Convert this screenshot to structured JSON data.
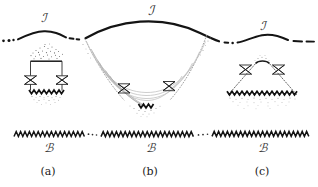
{
  "figure": {
    "background_color": "#ffffff",
    "ink_color": "#1a1a1a",
    "faint_color": "#b9b9b9",
    "dot_color": "#7a7a7a",
    "width": 318,
    "height": 187
  },
  "labels": {
    "scri_a": "ℐ",
    "scri_b": "ℐ",
    "scri_c": "ℐ",
    "boundary_a": "ℬ",
    "boundary_b": "ℬ",
    "boundary_c": "ℬ",
    "caption_a": "(a)",
    "caption_b": "(b)",
    "caption_c": "(c)"
  },
  "panels": [
    {
      "id": "a",
      "caption": "(a)",
      "scri_label": "ℐ",
      "boundary_label": "ℬ",
      "shape": "rectangle-trapped-region",
      "lightcones": 2,
      "has_top_scatter": true,
      "has_bottom_scatter": true,
      "has_zigzag_singularity": true
    },
    {
      "id": "b",
      "caption": "(b)",
      "scri_label": "ℐ",
      "boundary_label": "ℬ",
      "shape": "downward-funnel",
      "lightcones": 2,
      "has_top_scatter": false,
      "has_bottom_scatter": true,
      "has_zigzag_singularity": true,
      "inner_curves": 4
    },
    {
      "id": "c",
      "caption": "(c)",
      "scri_label": "ℐ",
      "boundary_label": "ℬ",
      "shape": "upward-triangle",
      "lightcones": 2,
      "has_top_scatter": true,
      "has_bottom_scatter": true,
      "has_zigzag_singularity": true
    }
  ]
}
